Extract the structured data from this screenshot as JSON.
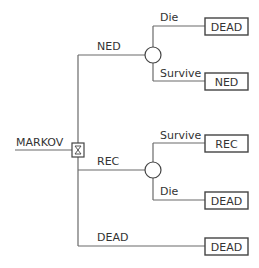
{
  "diagram": {
    "root": {
      "label": "MARKOV",
      "type": "markov-node"
    },
    "branches": [
      {
        "label": "NED",
        "type": "chance-node",
        "children": [
          {
            "label": "Die",
            "terminal": "DEAD"
          },
          {
            "label": "Survive",
            "terminal": "NED"
          }
        ]
      },
      {
        "label": "REC",
        "type": "chance-node",
        "children": [
          {
            "label": "Survive",
            "terminal": "REC"
          },
          {
            "label": "Die",
            "terminal": "DEAD"
          }
        ]
      },
      {
        "label": "DEAD",
        "terminal": "DEAD"
      }
    ]
  },
  "colors": {
    "line": "#6a6a6a",
    "node": "#444444",
    "text": "#333333"
  }
}
